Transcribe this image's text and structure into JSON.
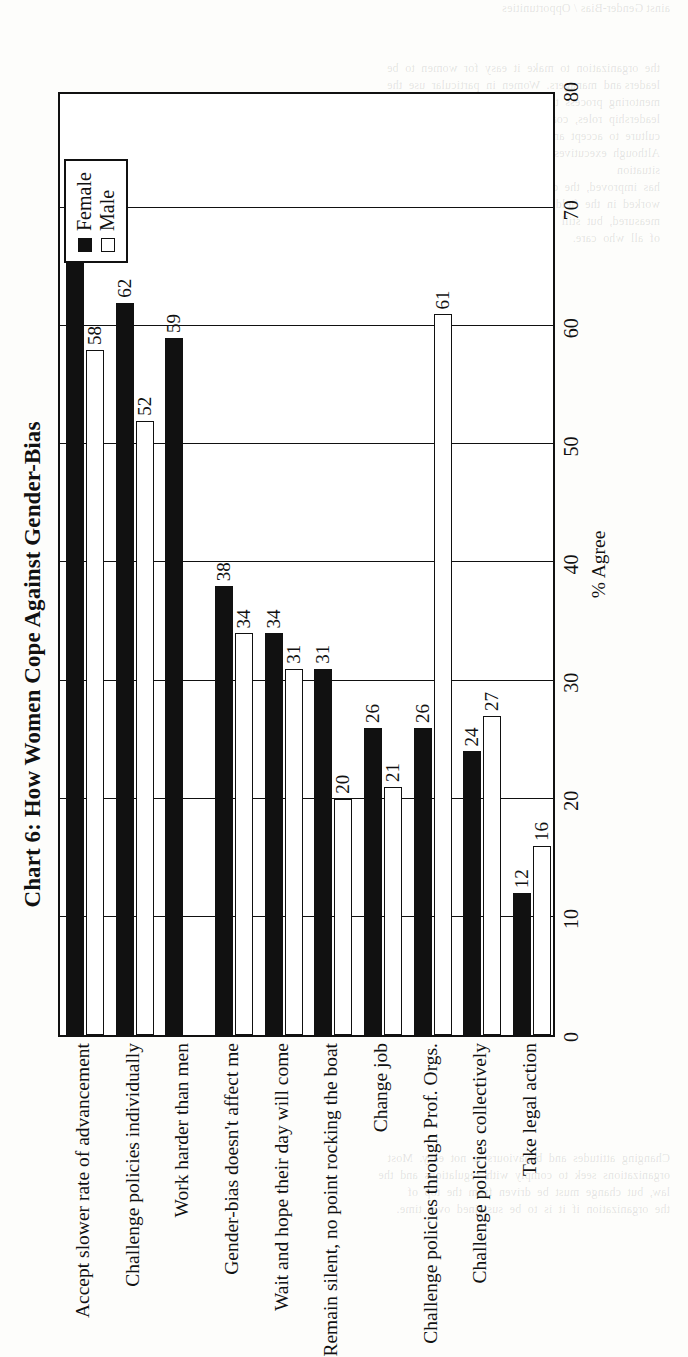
{
  "chart_data": {
    "type": "bar",
    "orientation": "horizontal",
    "title": "Chart 6: How Women Cope Against Gender-Bias",
    "xlabel": "% Agree",
    "ylabel": "",
    "xlim": [
      0,
      80
    ],
    "xticks": [
      0,
      10,
      20,
      30,
      40,
      50,
      60,
      70,
      80
    ],
    "grid": true,
    "grid_axis": "x",
    "legend": {
      "position": "top-right",
      "entries": [
        {
          "name": "Female",
          "color": "#111111",
          "fill": "solid"
        },
        {
          "name": "Male",
          "color": "#ffffff",
          "fill": "outline"
        }
      ]
    },
    "categories": [
      "Accept slower rate of advancement",
      "Challenge policies individually",
      "Work harder than men",
      "Gender-bias doesn't affect me",
      "Wait and hope their day will come",
      "Remain silent, no point rocking the boat",
      "Change job",
      "Challenge policies through Prof. Orgs.",
      "Challenge policies collectively",
      "Take legal action"
    ],
    "series": [
      {
        "name": "Female",
        "color": "#111111",
        "values": [
          69,
          62,
          59,
          38,
          34,
          31,
          26,
          26,
          24,
          12
        ]
      },
      {
        "name": "Male",
        "color": "#ffffff",
        "values": [
          58,
          52,
          null,
          34,
          31,
          20,
          21,
          61,
          27,
          16
        ]
      }
    ],
    "data_labels": {
      "Female": [
        "69",
        "62",
        "59",
        "38",
        "34",
        "31",
        "26",
        "26",
        "24",
        "12"
      ],
      "Male": [
        "58",
        "52",
        "",
        "34",
        "31",
        "20",
        "21",
        "61",
        "27",
        "16"
      ]
    }
  },
  "page": {
    "bleed_top": "ainst Gender-Bias / Opportunities",
    "bleed_mid": "the  organization  to  make  it  easy  for  women  to  be\nleaders and  managers.  Women  in  particular  use  the\nmentoring  process  to  prepare  other  women  to  take  on\nleadership  roles,  coaching  women  and  even  the  organizational\nculture  to  accept  and  support  the  process.\nAlthough  executives  in  the  survey  in  2004  believe  that  the  situation\nhas  improved,  the  data  indicates  otherwise.  For  those  who  have\nworked  in  the  field  for  a  long  time,  the  progress  seems  slow  and\nmeasured,  but  still  far  from  the  equality  that  is  the  ultimate  goal\nof  all  who  care.",
    "bleed_bot": "Changing  attitudes  and  behaviours  is  not  easy.  Most\norganizations  seek  to  comply  with  regulations  and  the\nlaw,  but  change  must  be  driven  from  the  top  of\nthe  organization  if  it  is  to  be  sustained  over  time."
  }
}
